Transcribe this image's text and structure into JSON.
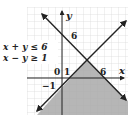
{
  "figure": {
    "type": "inequality-graph",
    "inequalities": [
      "x + y ≤ 6",
      "x − y ≥ 1"
    ],
    "axis_labels": {
      "x": "x",
      "y": "y"
    },
    "tick_labels": {
      "origin": "0",
      "x_one": "1",
      "x_six": "6",
      "y_six": "6",
      "y_neg_one": "−1"
    },
    "lines": [
      {
        "equation": "x + y = 6",
        "x_intercept": 6,
        "y_intercept": 6
      },
      {
        "equation": "x − y = 1",
        "x_intercept": 1,
        "y_intercept": -1
      }
    ],
    "intersection": [
      3.5,
      2.5
    ],
    "shaded_region": "below both lines (x + y ≤ 6 and x − y ≥ 1)",
    "colors": {
      "shade": "#a9a9a9",
      "grid": "#cfcfcf",
      "line": "#222222"
    }
  }
}
